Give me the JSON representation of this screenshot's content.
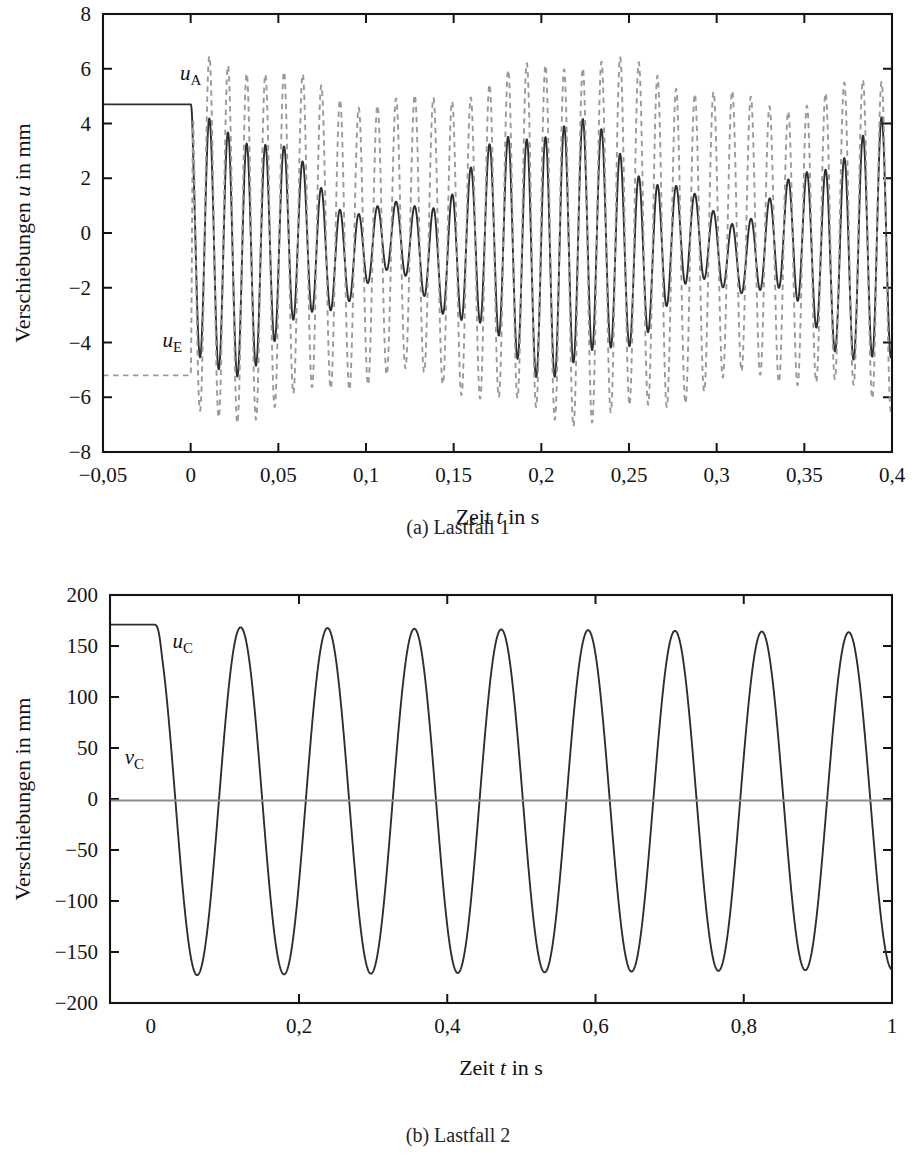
{
  "figure": {
    "background": "#ffffff",
    "ink": "#141414",
    "solid_color": "#2e2e2e",
    "dashed_color": "#9a9a9a",
    "flat_color": "#8c8c8c"
  },
  "panel_a": {
    "caption": "(a) Lastfall 1",
    "xlabel_pre": "Zeit ",
    "xlabel_ital": "t",
    "xlabel_post": " in s",
    "ylabel_pre": "Verschiebungen ",
    "ylabel_ital": "u",
    "ylabel_post": " in mm"
  },
  "panel_b": {
    "caption": "(b) Lastfall 2",
    "xlabel_pre": "Zeit ",
    "xlabel_ital": "t",
    "xlabel_post": " in s",
    "ylabel_pre": "Verschiebungen in mm",
    "ylabel_ital": "",
    "ylabel_post": ""
  },
  "chart_data": [
    {
      "id": "lastfall-1",
      "type": "line",
      "title": "(a) Lastfall 1",
      "xlabel": "Zeit t in s",
      "ylabel": "Verschiebungen u in mm",
      "xlim": [
        -0.05,
        0.4
      ],
      "ylim": [
        -8,
        8
      ],
      "xticks": [
        -0.05,
        0,
        0.05,
        0.1,
        0.15,
        0.2,
        0.25,
        0.3,
        0.35,
        0.4
      ],
      "xticklabels": [
        "−0,05",
        "0",
        "0,05",
        "0,1",
        "0,15",
        "0,2",
        "0,25",
        "0,3",
        "0,35",
        "0,4"
      ],
      "yticks": [
        -8,
        -6,
        -4,
        -2,
        0,
        2,
        4,
        6,
        8
      ],
      "yticklabels": [
        "−8",
        "−6",
        "−4",
        "−2",
        "0",
        "2",
        "4",
        "6",
        "8"
      ],
      "grid": false,
      "legend": "inline-annotations",
      "series": [
        {
          "name": "u_A",
          "label_text": "u",
          "label_sub": "A",
          "style": "solid",
          "color": "#2e2e2e",
          "label_x": 0.0,
          "label_y": 5.6,
          "model": {
            "kind": "hold-then-beat",
            "hold_value": 4.7,
            "hold_until": 0.0,
            "ramp": 0.0016,
            "carrier_period": 0.01065,
            "beat_period": 0.196,
            "beat_phase": -0.44,
            "amp_mean": 2.85,
            "amp_beat": 1.62,
            "offset": -0.52,
            "phase": 0.0,
            "secondary_period": 0.0565,
            "secondary_amp": 0.42
          }
        },
        {
          "name": "u_E",
          "label_text": "u",
          "label_sub": "E",
          "style": "dashed",
          "color": "#9a9a9a",
          "label_x": -0.0105,
          "label_y": -4.15,
          "model": {
            "kind": "hold-then-beat",
            "hold_value": -5.2,
            "hold_until": 0.0,
            "ramp": 0.0016,
            "carrier_period": 0.01065,
            "beat_period": 0.215,
            "beat_phase": -0.3,
            "amp_mean": 5.75,
            "amp_beat": 0.78,
            "offset": -0.25,
            "phase": 0.0,
            "secondary_period": 0.062,
            "secondary_amp": 0.3
          }
        }
      ]
    },
    {
      "id": "lastfall-2",
      "type": "line",
      "title": "(b) Lastfall 2",
      "xlabel": "Zeit t in s",
      "ylabel": "Verschiebungen in mm",
      "xlim": [
        -0.055,
        1.0
      ],
      "ylim": [
        -200,
        200
      ],
      "xticks": [
        0,
        0.2,
        0.4,
        0.6,
        0.8,
        1.0
      ],
      "xticklabels": [
        "0",
        "0,2",
        "0,4",
        "0,6",
        "0,8",
        "1"
      ],
      "yticks": [
        -200,
        -150,
        -100,
        -50,
        0,
        50,
        100,
        150,
        200
      ],
      "yticklabels": [
        "−200",
        "−150",
        "−100",
        "−50",
        "0",
        "50",
        "100",
        "150",
        "200"
      ],
      "grid": false,
      "legend": "inline-annotations",
      "series": [
        {
          "name": "u_C",
          "label_text": "u",
          "label_sub": "C",
          "style": "solid",
          "color": "#2e2e2e",
          "label_x": 0.043,
          "label_y": 148,
          "model": {
            "kind": "hold-then-cosine",
            "hold_value": 171,
            "hold_until": 0.004,
            "ramp": 0.012,
            "period": 0.1172,
            "amplitude": 171,
            "decay_per_second": 0.035,
            "offset": -2.0
          }
        },
        {
          "name": "v_C",
          "label_text": "v",
          "label_sub": "C",
          "style": "flat",
          "color": "#8c8c8c",
          "label_x": -0.022,
          "label_y": 34,
          "model": {
            "kind": "constant",
            "value": -1.5
          }
        }
      ]
    }
  ]
}
